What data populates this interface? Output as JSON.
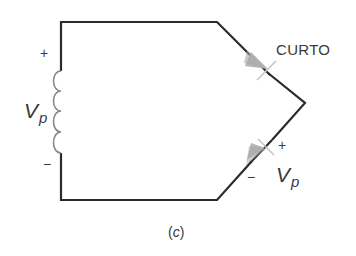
{
  "diagram": {
    "kind": "circuit-schematic",
    "caption": {
      "open": "(",
      "letter": "c",
      "close": ")"
    },
    "source": {
      "type": "inductor-secondary-winding",
      "label_main": "V",
      "label_sub": "p",
      "polarity_top": "+",
      "polarity_bottom": "−"
    },
    "diode_top": {
      "state_label": "CURTO",
      "direction": "forward, pointing down-right"
    },
    "diode_bottom": {
      "label_main": "V",
      "label_sub": "p",
      "polarity_plus": "+",
      "polarity_minus": "−",
      "direction": "reverse, pointing up-right"
    },
    "colors": {
      "wire": "#2b2b2b",
      "coil": "#8a8a8a",
      "diode": "#b5b5b5",
      "text": "#3a3a3a"
    }
  }
}
